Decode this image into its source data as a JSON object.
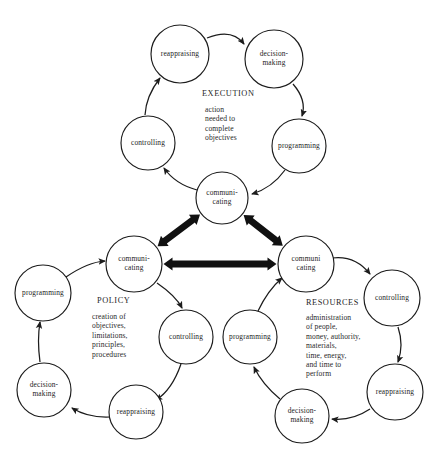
{
  "diagram": {
    "background_color": "#ffffff",
    "line_color": "#1c1c1c",
    "text_color": "#232323",
    "groups": [
      {
        "id": "execution",
        "title": "EXECUTION",
        "description_lines": [
          "action",
          "needed to",
          "complete",
          "objectives"
        ],
        "title_pos": {
          "x": 202,
          "y": 96
        },
        "desc_pos": {
          "x": 205,
          "y": 112
        },
        "nodes": [
          {
            "id": "exec-reappraising",
            "label_lines": [
              "reappraising"
            ],
            "cx": 180,
            "cy": 54,
            "r": 29
          },
          {
            "id": "exec-decision-making",
            "label_lines": [
              "decision-",
              "making"
            ],
            "cx": 274,
            "cy": 59,
            "r": 29
          },
          {
            "id": "exec-programming",
            "label_lines": [
              "programming"
            ],
            "cx": 299,
            "cy": 146,
            "r": 27
          },
          {
            "id": "exec-communicating",
            "label_lines": [
              "communi-",
              "cating"
            ],
            "cx": 222,
            "cy": 198,
            "r": 26
          },
          {
            "id": "exec-controlling",
            "label_lines": [
              "controlling"
            ],
            "cx": 148,
            "cy": 143,
            "r": 27
          }
        ]
      },
      {
        "id": "policy",
        "title": "POLICY",
        "description_lines": [
          "creation of",
          "objectives,",
          "limitations,",
          "principles,",
          "procedures"
        ],
        "title_pos": {
          "x": 97,
          "y": 303
        },
        "desc_pos": {
          "x": 92,
          "y": 319
        },
        "nodes": [
          {
            "id": "policy-communicating",
            "label_lines": [
              "communi-",
              "cating"
            ],
            "cx": 134,
            "cy": 264,
            "r": 28
          },
          {
            "id": "policy-controlling",
            "label_lines": [
              "controlling"
            ],
            "cx": 186,
            "cy": 337,
            "r": 27
          },
          {
            "id": "policy-reappraising",
            "label_lines": [
              "reappraising"
            ],
            "cx": 136,
            "cy": 412,
            "r": 27
          },
          {
            "id": "policy-decision-making",
            "label_lines": [
              "decision-",
              "making"
            ],
            "cx": 44,
            "cy": 390,
            "r": 27
          },
          {
            "id": "policy-programming",
            "label_lines": [
              "programming"
            ],
            "cx": 43,
            "cy": 293,
            "r": 28
          }
        ]
      },
      {
        "id": "resources",
        "title": "RESOURCES",
        "description_lines": [
          "administration",
          "of people,",
          "money, authority,",
          "materials,",
          "time, energy,",
          "and time to",
          "perform"
        ],
        "title_pos": {
          "x": 306,
          "y": 305
        },
        "desc_pos": {
          "x": 306,
          "y": 320
        },
        "nodes": [
          {
            "id": "res-communicating",
            "label_lines": [
              "communi",
              "cating"
            ],
            "cx": 306,
            "cy": 264,
            "r": 28
          },
          {
            "id": "res-controlling",
            "label_lines": [
              "controlling"
            ],
            "cx": 392,
            "cy": 298,
            "r": 28
          },
          {
            "id": "res-reappraising",
            "label_lines": [
              "reappraising"
            ],
            "cx": 395,
            "cy": 392,
            "r": 28
          },
          {
            "id": "res-decision-making",
            "label_lines": [
              "decision-",
              "making"
            ],
            "cx": 302,
            "cy": 416,
            "r": 27
          },
          {
            "id": "res-programming",
            "label_lines": [
              "programming"
            ],
            "cx": 250,
            "cy": 337,
            "r": 27
          }
        ]
      }
    ],
    "thin_arrows": [
      {
        "id": "exec-reappraising-to-decision",
        "from": "exec-reappraising",
        "to": "exec-decision-making",
        "path": "M 207 38 Q 232 28 244 44"
      },
      {
        "id": "exec-decision-to-programming",
        "from": "exec-decision-making",
        "to": "exec-programming",
        "path": "M 293 84 Q 307 100 302 116"
      },
      {
        "id": "exec-programming-to-communicating",
        "from": "exec-programming",
        "to": "exec-communicating",
        "path": "M 285 170 Q 272 188 252 194"
      },
      {
        "id": "exec-communicating-to-controlling",
        "from": "exec-communicating",
        "to": "exec-controlling",
        "path": "M 197 190 Q 175 184 164 168"
      },
      {
        "id": "exec-controlling-to-reappraising",
        "from": "exec-controlling",
        "to": "exec-reappraising",
        "path": "M 145 115 Q 146 96 160 78"
      },
      {
        "id": "policy-communicating-to-controlling",
        "from": "policy-communicating",
        "to": "policy-controlling",
        "path": "M 157 283 Q 176 296 182 308"
      },
      {
        "id": "policy-controlling-to-reappraising",
        "from": "policy-controlling",
        "to": "policy-reappraising",
        "path": "M 181 364 Q 172 390 156 400"
      },
      {
        "id": "policy-reappraising-to-decision",
        "from": "policy-reappraising",
        "to": "policy-decision-making",
        "path": "M 110 417 Q 88 418 72 408"
      },
      {
        "id": "policy-decision-to-programming",
        "from": "policy-decision-making",
        "to": "policy-programming",
        "path": "M 40 362 Q 37 340 40 322"
      },
      {
        "id": "policy-programming-to-communicating",
        "from": "policy-programming",
        "to": "policy-communicating",
        "path": "M 66 277 Q 88 262 105 261"
      },
      {
        "id": "res-communicating-to-controlling",
        "from": "res-communicating",
        "to": "res-controlling",
        "path": "M 332 258 Q 355 255 370 274"
      },
      {
        "id": "res-controlling-to-reappraising",
        "from": "res-controlling",
        "to": "res-reappraising",
        "path": "M 398 327 Q 404 345 398 362"
      },
      {
        "id": "res-reappraising-to-decision",
        "from": "res-reappraising",
        "to": "res-decision-making",
        "path": "M 370 409 Q 352 421 332 419"
      },
      {
        "id": "res-decision-to-programming",
        "from": "res-decision-making",
        "to": "res-programming",
        "path": "M 280 399 Q 262 384 254 367"
      },
      {
        "id": "res-programming-to-communicating",
        "from": "res-programming",
        "to": "res-communicating",
        "path": "M 258 311 Q 268 290 282 278"
      }
    ],
    "thick_arrows": [
      {
        "id": "exec-to-policy-link",
        "from": "exec-communicating",
        "to": "policy-communicating",
        "label": "execution-policy double arrow"
      },
      {
        "id": "exec-to-resources-link",
        "from": "exec-communicating",
        "to": "res-communicating",
        "label": "execution-resources double arrow"
      },
      {
        "id": "policy-to-resources-link",
        "from": "policy-communicating",
        "to": "res-communicating",
        "label": "policy-resources double arrow"
      }
    ]
  }
}
